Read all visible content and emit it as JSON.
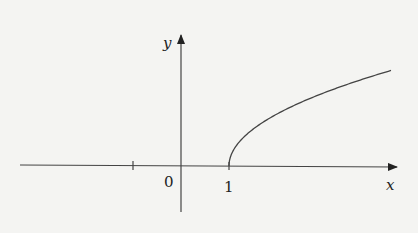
{
  "chart_data": {
    "type": "line",
    "title": "",
    "xlabel": "x",
    "ylabel": "y",
    "function": "y = sqrt(x - 1)",
    "x_ticks": [
      {
        "value": -1,
        "label": ""
      },
      {
        "value": 0,
        "label": "0"
      },
      {
        "value": 1,
        "label": "1"
      }
    ],
    "series": [
      {
        "name": "curve",
        "x": [
          1,
          1.25,
          1.5,
          2,
          2.5,
          3,
          3.5,
          4.375
        ],
        "y": [
          0,
          0.5,
          0.707,
          1,
          1.225,
          1.414,
          1.581,
          1.837
        ]
      }
    ],
    "xlim": [
      -3.4,
      4.5
    ],
    "ylim": [
      -1.0,
      2.5
    ],
    "grid": false,
    "legend": "none"
  },
  "labels": {
    "x_axis": "x",
    "y_axis": "y",
    "origin": "0",
    "one": "1"
  }
}
